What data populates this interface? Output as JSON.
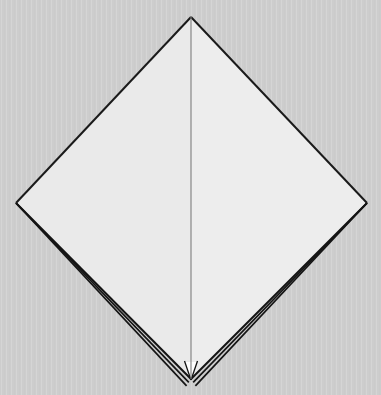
{
  "scene": {
    "title": "Folded paper model",
    "width": 381,
    "height": 395,
    "background_color": "#cdcdcd",
    "background_texture": "vertical-stripes"
  },
  "model": {
    "name": "origami-kite-base",
    "description": "Square sheet rotated 45 degrees, folded in half along the vertical diagonal, viewed flat with layered paper edges exposed along the two lower edges.",
    "outline_color": "#1a1a1a",
    "vertices": {
      "top": [
        191,
        17
      ],
      "left": [
        16,
        203
      ],
      "right": [
        367,
        203
      ],
      "bottom": [
        191,
        379
      ]
    },
    "faces": [
      {
        "name": "left-face",
        "fill_color": "#eaeaea",
        "points": "191,17 16,203 191,379"
      },
      {
        "name": "right-face",
        "fill_color": "#ededed",
        "points": "191,17 367,203 191,379"
      }
    ],
    "center_fold": {
      "name": "center-fold-line",
      "color": "#7d7d7d",
      "width": 1.1,
      "from": [
        191,
        17
      ],
      "to": [
        191,
        379
      ]
    },
    "layer_edges": {
      "count_per_side": 3,
      "color": "#141414",
      "note": "Stacked paper layers visible along the lower-left and lower-right edges, converging to a single line near the side vertices and fanning out toward the bottom tip.",
      "left_offsets": [
        0,
        4,
        8
      ],
      "right_offsets": [
        0,
        4,
        8
      ]
    },
    "bottom_notch": {
      "name": "bottom-tip-notch",
      "fill_color": "#ffffff",
      "points": "185,362 197,362 191,379"
    }
  }
}
